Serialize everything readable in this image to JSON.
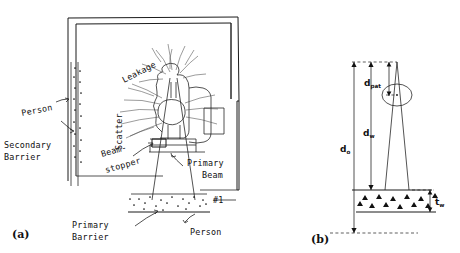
{
  "figure": {
    "type": "technical-diagram",
    "panels": [
      {
        "id": "a",
        "caption": "(a)",
        "description": "Plan view of linear accelerator vault showing maze, barriers and radiation components",
        "labels": {
          "person_secondary": "Person",
          "secondary_barrier": "Secondary\nBarrier",
          "secondary_barrier_line1": "Secondary",
          "secondary_barrier_line2": "Barrier",
          "leakage": "Leakage",
          "scatter": "Scatter",
          "beam_stopper_line1": "Beam-",
          "beam_stopper_line2": "stopper",
          "primary_beam_line1": "Primary",
          "primary_beam_line2": "Beam",
          "primary_barrier_line1": "Primary",
          "primary_barrier_line2": "Barrier",
          "point_marker": "#1",
          "person_primary": "Person"
        }
      },
      {
        "id": "b",
        "caption": "(b)",
        "description": "Elevation geometry for primary barrier thickness calculation",
        "labels": {
          "d_pat": "d",
          "d_pat_sub": "pat",
          "d_w": "d",
          "d_w_sub": "w",
          "d_o": "d",
          "d_o_sub": "o",
          "t_w": "t",
          "t_w_sub": "w"
        }
      }
    ],
    "colors": {
      "ink": "#1a1a1a",
      "sketch": "#4a4a4a",
      "background": "#ffffff"
    }
  }
}
